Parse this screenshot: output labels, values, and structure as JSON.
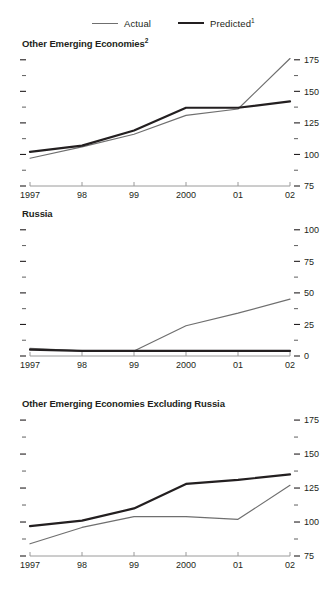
{
  "legend": {
    "entries": [
      {
        "label": "Actual",
        "sup": "",
        "color": "#6f6f6f",
        "width": 1.2,
        "name": "actual"
      },
      {
        "label": "Predicted",
        "sup": "1",
        "color": "#231f20",
        "width": 2.4,
        "name": "predicted"
      }
    ]
  },
  "chart_data": [
    {
      "type": "line",
      "title": "Other Emerging Economies",
      "title_sup": "2",
      "xlabel": "",
      "ylabel": "",
      "x": [
        "1997",
        "98",
        "99",
        "2000",
        "01",
        "02"
      ],
      "xticklabels": [
        "1997",
        "98",
        "99",
        "2000",
        "01",
        "02"
      ],
      "yticks": [
        75,
        100,
        125,
        150,
        175
      ],
      "yminorticks": [
        87.5,
        112.5,
        137.5,
        162.5
      ],
      "ylim": [
        75,
        178
      ],
      "grid": false,
      "legend_position": "top",
      "series": [
        {
          "name": "Actual",
          "color": "#6f6f6f",
          "width": 1.2,
          "values": [
            97,
            106,
            116,
            131,
            136,
            176
          ]
        },
        {
          "name": "Predicted",
          "color": "#231f20",
          "width": 2.2,
          "values": [
            102,
            107,
            119,
            137,
            137,
            142
          ]
        }
      ]
    },
    {
      "type": "line",
      "title": "Russia",
      "title_sup": "",
      "xlabel": "",
      "ylabel": "",
      "x": [
        "1997",
        "98",
        "99",
        "2000",
        "01",
        "02"
      ],
      "xticklabels": [
        "1997",
        "98",
        "99",
        "2000",
        "01",
        "02"
      ],
      "yticks": [
        0,
        25,
        50,
        75,
        100
      ],
      "yminorticks": [
        12.5,
        37.5,
        62.5,
        87.5
      ],
      "ylim": [
        0,
        103
      ],
      "grid": false,
      "legend_position": "top",
      "series": [
        {
          "name": "Actual",
          "color": "#6f6f6f",
          "width": 1.2,
          "values": [
            6,
            4,
            4,
            24,
            34,
            45
          ]
        },
        {
          "name": "Predicted",
          "color": "#231f20",
          "width": 2.2,
          "values": [
            5,
            4,
            4,
            4,
            4,
            4
          ]
        }
      ]
    },
    {
      "type": "line",
      "title": "Other Emerging Economies Excluding Russia",
      "title_sup": "",
      "xlabel": "",
      "ylabel": "",
      "x": [
        "1997",
        "98",
        "99",
        "2000",
        "01",
        "02"
      ],
      "xticklabels": [
        "1997",
        "98",
        "99",
        "2000",
        "01",
        "02"
      ],
      "yticks": [
        75,
        100,
        125,
        150,
        175
      ],
      "yminorticks": [
        87.5,
        112.5,
        137.5,
        162.5
      ],
      "ylim": [
        75,
        178
      ],
      "grid": false,
      "legend_position": "top",
      "series": [
        {
          "name": "Actual",
          "color": "#6f6f6f",
          "width": 1.2,
          "values": [
            84,
            96,
            104,
            104,
            102,
            127
          ]
        },
        {
          "name": "Predicted",
          "color": "#231f20",
          "width": 2.2,
          "values": [
            97,
            101,
            110,
            128,
            131,
            135
          ]
        }
      ]
    }
  ]
}
